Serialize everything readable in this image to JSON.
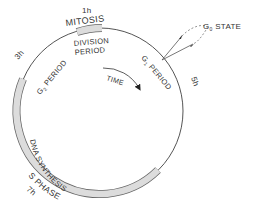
{
  "diagram": {
    "phases": [
      {
        "id": "mitosis",
        "label": "MITOSIS",
        "duration": "1h",
        "sublabel_1": "DIVISION",
        "sublabel_2": "PERIOD"
      },
      {
        "id": "g1",
        "label_prefix": "G",
        "label_sub": "1",
        "label_suffix": " PERIOD",
        "duration": "5h"
      },
      {
        "id": "s",
        "label_top": "DNA SYNTHESIS",
        "label_bottom": "S PHASE",
        "duration": "7h"
      },
      {
        "id": "g2",
        "label_prefix": "G",
        "label_sub": "2",
        "label_suffix": " PERIOD",
        "duration": "3h"
      }
    ],
    "g0": {
      "prefix": "G",
      "sub": "0",
      "suffix": " STATE"
    },
    "arrow_label": "TIME",
    "colors": {
      "ring": "#555555",
      "band_fill": "#dcdcdc",
      "band_stroke": "#666666",
      "text": "#333333"
    }
  }
}
